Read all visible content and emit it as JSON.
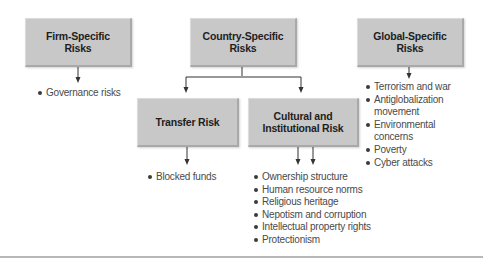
{
  "diagram": {
    "nodes": {
      "firm": {
        "line1": "Firm-Specific",
        "line2": "Risks"
      },
      "country": {
        "line1": "Country-Specific",
        "line2": "Risks"
      },
      "global": {
        "line1": "Global-Specific",
        "line2": "Risks"
      },
      "transfer": {
        "line1": "Transfer Risk",
        "line2": ""
      },
      "cultural": {
        "line1": "Cultural and",
        "line2": "Institutional Risk"
      }
    },
    "lists": {
      "firm": [
        "Governance risks"
      ],
      "transfer": [
        "Blocked funds"
      ],
      "cultural": [
        "Ownership structure",
        "Human resource norms",
        "Religious heritage",
        "Nepotism and corruption",
        "Intellectual property rights",
        "Protectionism"
      ],
      "global": [
        "Terrorism and war",
        "Antiglobalization movement",
        "Environmental concerns",
        "Poverty",
        "Cyber attacks"
      ]
    },
    "edges": [
      {
        "from": "firm",
        "to": "firm-list"
      },
      {
        "from": "country",
        "to": "transfer"
      },
      {
        "from": "country",
        "to": "cultural"
      },
      {
        "from": "global",
        "to": "global-list"
      },
      {
        "from": "transfer",
        "to": "transfer-list"
      },
      {
        "from": "cultural",
        "to": "cultural-list"
      }
    ],
    "colors": {
      "box_fill": "#c8c8c8",
      "box_text": "#1e1e1e",
      "list_text": "#4a4a4a",
      "connector": "#333333"
    }
  }
}
